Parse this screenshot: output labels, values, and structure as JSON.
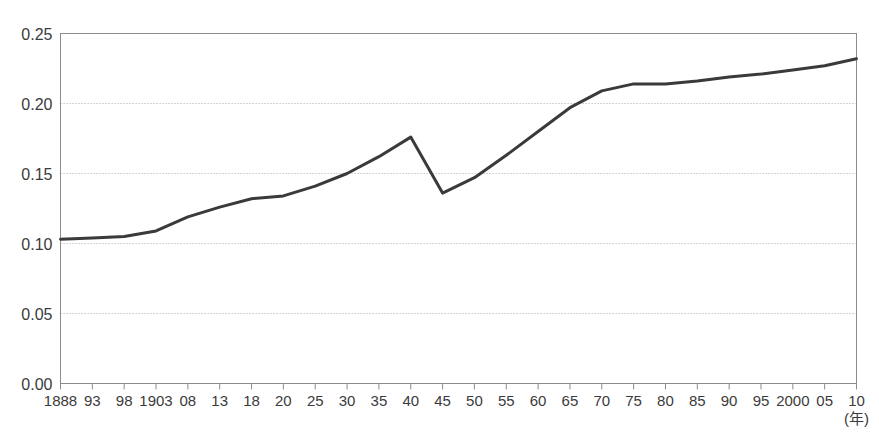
{
  "chart_data": {
    "type": "line",
    "title": "",
    "subtitle": "",
    "xlabel": "(年)",
    "ylabel": "",
    "xlim": [
      1888,
      2010
    ],
    "ylim": [
      0.0,
      0.25
    ],
    "grid": true,
    "grid_axis": "y",
    "legend": false,
    "legend_position": "none",
    "line_color": "#3a3a3a",
    "axis_color": "#8c8c8c",
    "grid_color": "#b9b9b9",
    "background_color": "#ffffff",
    "ytick_labels": [
      "0.00",
      "0.05",
      "0.10",
      "0.15",
      "0.20",
      "0.25"
    ],
    "ytick_values": [
      0.0,
      0.05,
      0.1,
      0.15,
      0.2,
      0.25
    ],
    "xtick_labels": [
      "1888",
      "93",
      "98",
      "1903",
      "08",
      "13",
      "18",
      "20",
      "25",
      "30",
      "35",
      "40",
      "45",
      "50",
      "55",
      "60",
      "65",
      "70",
      "75",
      "80",
      "85",
      "90",
      "95",
      "2000",
      "05",
      "10"
    ],
    "x": [
      1888,
      1893,
      1898,
      1903,
      1908,
      1913,
      1918,
      1920,
      1925,
      1930,
      1935,
      1940,
      1945,
      1950,
      1955,
      1960,
      1965,
      1970,
      1975,
      1980,
      1985,
      1990,
      1995,
      2000,
      2005,
      2010
    ],
    "values": [
      0.103,
      0.104,
      0.105,
      0.109,
      0.119,
      0.126,
      0.132,
      0.134,
      0.141,
      0.15,
      0.162,
      0.176,
      0.136,
      0.147,
      0.163,
      0.18,
      0.197,
      0.209,
      0.214,
      0.214,
      0.216,
      0.219,
      0.221,
      0.224,
      0.227,
      0.232
    ],
    "series": [
      {
        "name": "series-1",
        "values": [
          0.103,
          0.104,
          0.105,
          0.109,
          0.119,
          0.126,
          0.132,
          0.134,
          0.141,
          0.15,
          0.162,
          0.176,
          0.136,
          0.147,
          0.163,
          0.18,
          0.197,
          0.209,
          0.214,
          0.214,
          0.216,
          0.219,
          0.221,
          0.224,
          0.227,
          0.232
        ]
      }
    ]
  }
}
